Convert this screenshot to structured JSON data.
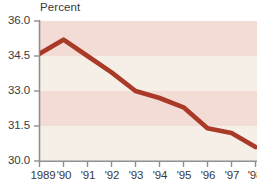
{
  "chart_data": {
    "type": "line",
    "title": "",
    "xlabel": "",
    "ylabel": "Percent",
    "ylim": [
      30.0,
      36.0
    ],
    "yticks": [
      36.0,
      34.5,
      33.0,
      31.5,
      30.0
    ],
    "ytick_labels": [
      "36.0",
      "34.5",
      "33.0",
      "31.5",
      "30.0"
    ],
    "grid": false,
    "banded_background": true,
    "legend": "none",
    "categories": [
      "1989",
      "'90",
      "'91",
      "'92",
      "'93",
      "'94",
      "'95",
      "'96",
      "'97",
      "'98"
    ],
    "x": [
      1989,
      1990,
      1991,
      1992,
      1993,
      1994,
      1995,
      1996,
      1997,
      1998
    ],
    "values": [
      34.6,
      35.2,
      34.5,
      33.8,
      33.0,
      32.7,
      32.3,
      31.4,
      31.2,
      30.6
    ],
    "series": [
      {
        "name": "Percent",
        "values": [
          34.6,
          35.2,
          34.5,
          33.8,
          33.0,
          32.7,
          32.3,
          31.4,
          31.2,
          30.6
        ]
      }
    ]
  },
  "axis": {
    "unit_label": "Percent",
    "y_labels": [
      "36.0",
      "34.5",
      "33.0",
      "31.5",
      "30.0"
    ],
    "x_labels": [
      "1989",
      "'90",
      "'91",
      "'92",
      "'93",
      "'94",
      "'95",
      "'96",
      "'97",
      "'98"
    ]
  },
  "colors": {
    "line": "#a93a28",
    "band_pink": "#f3dcd6",
    "band_cream": "#f5efe7",
    "axis": "#8f8f92",
    "text": "#39393b",
    "background": "#ffffff"
  }
}
